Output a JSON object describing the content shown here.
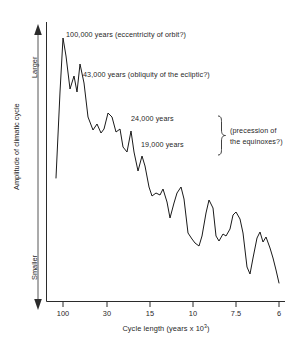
{
  "chart_data": {
    "type": "line",
    "title": "",
    "xlabel": "Cycle length (years x 10³)",
    "xlabel_base": "Cycle length (years x 10",
    "xlabel_exp": "3",
    "xlabel_tail": ")",
    "ylabel": "Amplitude of climatic cycle",
    "y_axis_top_label": "Larger",
    "y_axis_bottom_label": "Smaller",
    "grid": false,
    "legend": "none",
    "x_scale": "reciprocal-frequency (cycle length decreasing to the right)",
    "x_tick_labels": [
      "100",
      "30",
      "15",
      "10",
      "7.5",
      "6"
    ],
    "x_tick_values": [
      100,
      30,
      15,
      10,
      7.5,
      6
    ],
    "x_tick_px": [
      63,
      107,
      150,
      193,
      236,
      279
    ],
    "ylim_labels": [
      "Smaller",
      "Larger"
    ],
    "annotations": [
      {
        "id": "peak-100k",
        "text": "100,000 years (eccentricity of orbit?)",
        "points_to_cycle_length": 100
      },
      {
        "id": "peak-43k",
        "text": "43,000 years (obliquity of the ecliptic?)",
        "points_to_cycle_length": 43
      },
      {
        "id": "peak-24k",
        "text": "24,000 years",
        "points_to_cycle_length": 24
      },
      {
        "id": "peak-19k",
        "text": "19,000 years",
        "points_to_cycle_length": 19
      },
      {
        "id": "precession-brace",
        "text_line_1": "(precession of",
        "text_line_2": "the equinoxes?)",
        "groups": [
          "24,000 years",
          "19,000 years"
        ]
      }
    ],
    "series": [
      {
        "name": "Amplitude of climatic cycle",
        "color": "#1a1a1a",
        "description": "Spectral power of climate record vs. cycle length; sharp peaks at 100ka, 43ka, 24ka and 19ka, with a declining jagged tail toward shorter cycles.",
        "points_px": [
          [
            56,
            178
          ],
          [
            60,
            92
          ],
          [
            63,
            38
          ],
          [
            66,
            56
          ],
          [
            70,
            89
          ],
          [
            74,
            76
          ],
          [
            77,
            92
          ],
          [
            80,
            64
          ],
          [
            84,
            83
          ],
          [
            88,
            117
          ],
          [
            93,
            130
          ],
          [
            97,
            124
          ],
          [
            101,
            133
          ],
          [
            104,
            129
          ],
          [
            108,
            113
          ],
          [
            112,
            117
          ],
          [
            116,
            132
          ],
          [
            120,
            129
          ],
          [
            123,
            147
          ],
          [
            127,
            152
          ],
          [
            131,
            131
          ],
          [
            134,
            152
          ],
          [
            138,
            171
          ],
          [
            142,
            156
          ],
          [
            145,
            166
          ],
          [
            149,
            187
          ],
          [
            152,
            196
          ],
          [
            156,
            193
          ],
          [
            160,
            195
          ],
          [
            163,
            189
          ],
          [
            167,
            202
          ],
          [
            170,
            218
          ],
          [
            174,
            203
          ],
          [
            177,
            193
          ],
          [
            181,
            187
          ],
          [
            184,
            199
          ],
          [
            188,
            233
          ],
          [
            192,
            239
          ],
          [
            195,
            243
          ],
          [
            199,
            246
          ],
          [
            202,
            236
          ],
          [
            206,
            213
          ],
          [
            209,
            200
          ],
          [
            213,
            208
          ],
          [
            216,
            236
          ],
          [
            219,
            241
          ],
          [
            223,
            234
          ],
          [
            226,
            236
          ],
          [
            230,
            229
          ],
          [
            233,
            215
          ],
          [
            236,
            212
          ],
          [
            240,
            219
          ],
          [
            243,
            233
          ],
          [
            247,
            267
          ],
          [
            250,
            274
          ],
          [
            253,
            258
          ],
          [
            257,
            238
          ],
          [
            260,
            232
          ],
          [
            263,
            242
          ],
          [
            266,
            237
          ],
          [
            270,
            248
          ],
          [
            273,
            258
          ],
          [
            276,
            270
          ],
          [
            279,
            283
          ]
        ]
      }
    ]
  },
  "axes": {
    "y_axis_label_text": "Amplitude of climatic cycle",
    "y_top_text": "Larger",
    "y_bottom_text": "Smaller"
  }
}
